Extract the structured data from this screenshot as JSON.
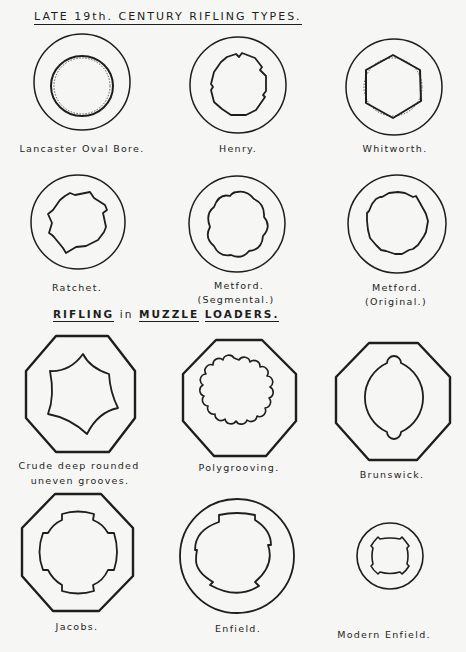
{
  "headers": {
    "top": "LATE 19th. CENTURY RIFLING TYPES.",
    "bottom": {
      "part1": "RIFLING",
      "part2": "in",
      "part3": "MUZZLE",
      "part4": "LOADERS."
    }
  },
  "diagrams": [
    {
      "id": "lancaster",
      "label": "Lancaster Oval Bore.",
      "section": "late-19th-century"
    },
    {
      "id": "henry",
      "label": "Henry.",
      "section": "late-19th-century"
    },
    {
      "id": "whitworth",
      "label": "Whitworth.",
      "section": "late-19th-century"
    },
    {
      "id": "ratchet",
      "label": "Ratchet.",
      "section": "late-19th-century"
    },
    {
      "id": "metford-segmental",
      "label": "Metford.",
      "sublabel": "(Segmental.)",
      "section": "late-19th-century"
    },
    {
      "id": "metford-original",
      "label": "Metford.",
      "sublabel": "(Original.)",
      "section": "late-19th-century"
    },
    {
      "id": "crude",
      "label": "Crude deep rounded",
      "sublabel": "uneven grooves.",
      "section": "muzzle-loaders"
    },
    {
      "id": "polygrooving",
      "label": "Polygrooving.",
      "section": "muzzle-loaders"
    },
    {
      "id": "brunswick",
      "label": "Brunswick.",
      "section": "muzzle-loaders"
    },
    {
      "id": "jacobs",
      "label": "Jacobs.",
      "section": "muzzle-loaders"
    },
    {
      "id": "enfield",
      "label": "Enfield.",
      "section": "muzzle-loaders"
    },
    {
      "id": "modern-enfield",
      "label": "Modern Enfield.",
      "section": "muzzle-loaders"
    }
  ],
  "colors": {
    "ink": "#1e1e1e",
    "paper": "#f6f6f4"
  }
}
